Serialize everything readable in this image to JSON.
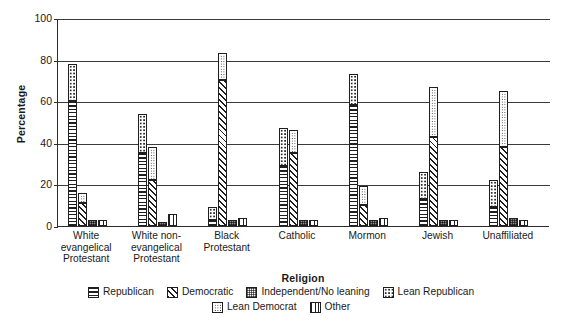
{
  "top_caption": "",
  "axes": {
    "ylabel": "Percentage",
    "xlabel": "Religion",
    "yticks": [
      "0",
      "20",
      "40",
      "60",
      "80",
      "100"
    ]
  },
  "legend": {
    "row1": [
      {
        "label": "Republican",
        "pattern": "p-rep",
        "icon": "horizontal-lines-swatch"
      },
      {
        "label": "Democratic",
        "pattern": "p-dem",
        "icon": "diagonal-hatch-swatch"
      },
      {
        "label": "Independent/No leaning",
        "pattern": "p-ind",
        "icon": "dark-speckle-swatch"
      },
      {
        "label": "Lean Republican",
        "pattern": "p-lrep",
        "icon": "open-dots-swatch"
      }
    ],
    "row2": [
      {
        "label": "Lean Democrat",
        "pattern": "p-ldem",
        "icon": "fine-dots-swatch"
      },
      {
        "label": "Other",
        "pattern": "p-oth",
        "icon": "vertical-lines-swatch"
      }
    ]
  },
  "chart_data": {
    "type": "bar",
    "title": "",
    "xlabel": "Religion",
    "ylabel": "Percentage",
    "ylim": [
      0,
      100
    ],
    "yticks": [
      0,
      20,
      40,
      60,
      80,
      100
    ],
    "grid": true,
    "legend_position": "bottom",
    "stacked_pairs": [
      "Republican + Lean Republican stacked on the Republican bar",
      "Democratic + Lean Democrat stacked on the Democratic bar"
    ],
    "categories": [
      "White evangelical Protestant",
      "White non-evangelical Protestant",
      "Black Protestant",
      "Catholic",
      "Mormon",
      "Jewish",
      "Unaffiliated"
    ],
    "series": [
      {
        "name": "Republican",
        "values": [
          60,
          35,
          3,
          29,
          58,
          13,
          9
        ]
      },
      {
        "name": "Lean Republican",
        "values": [
          18,
          19,
          6,
          18,
          15,
          13,
          13
        ]
      },
      {
        "name": "Democratic",
        "values": [
          11,
          22,
          70,
          35,
          10,
          43,
          38
        ]
      },
      {
        "name": "Lean Democrat",
        "values": [
          5,
          16,
          13,
          11,
          9,
          24,
          27
        ]
      },
      {
        "name": "Independent/No leaning",
        "values": [
          3,
          2,
          3,
          3,
          3,
          3,
          4
        ]
      },
      {
        "name": "Other",
        "values": [
          3,
          6,
          4,
          3,
          4,
          3,
          3
        ]
      }
    ],
    "bar_totals": {
      "Republican_stack": [
        78,
        54,
        9,
        47,
        73,
        26,
        22
      ],
      "Democratic_stack": [
        16,
        38,
        83,
        46,
        19,
        67,
        65
      ]
    }
  },
  "groups": [
    {
      "name": "White evangelical Protestant",
      "label_lines": [
        "White",
        "evangelical",
        "Protestant"
      ],
      "bars": [
        {
          "key": "republican",
          "base": 60,
          "top": 18,
          "base_pattern": "p-rep",
          "top_pattern": "p-lrep"
        },
        {
          "key": "democratic",
          "base": 11,
          "top": 5,
          "base_pattern": "p-dem",
          "top_pattern": "p-ldem"
        },
        {
          "key": "independent",
          "base": 3,
          "top": 0,
          "base_pattern": "p-ind",
          "top_pattern": ""
        },
        {
          "key": "other",
          "base": 3,
          "top": 0,
          "base_pattern": "p-oth",
          "top_pattern": ""
        }
      ]
    },
    {
      "name": "White non-evangelical Protestant",
      "label_lines": [
        "White non-",
        "evangelical",
        "Protestant"
      ],
      "bars": [
        {
          "key": "republican",
          "base": 35,
          "top": 19,
          "base_pattern": "p-rep",
          "top_pattern": "p-lrep"
        },
        {
          "key": "democratic",
          "base": 22,
          "top": 16,
          "base_pattern": "p-dem",
          "top_pattern": "p-ldem"
        },
        {
          "key": "independent",
          "base": 2,
          "top": 0,
          "base_pattern": "p-ind",
          "top_pattern": ""
        },
        {
          "key": "other",
          "base": 6,
          "top": 0,
          "base_pattern": "p-oth",
          "top_pattern": ""
        }
      ]
    },
    {
      "name": "Black Protestant",
      "label_lines": [
        "Black",
        "Protestant"
      ],
      "bars": [
        {
          "key": "republican",
          "base": 3,
          "top": 6,
          "base_pattern": "p-rep",
          "top_pattern": "p-lrep"
        },
        {
          "key": "democratic",
          "base": 70,
          "top": 13,
          "base_pattern": "p-dem",
          "top_pattern": "p-ldem"
        },
        {
          "key": "independent",
          "base": 3,
          "top": 0,
          "base_pattern": "p-ind",
          "top_pattern": ""
        },
        {
          "key": "other",
          "base": 4,
          "top": 0,
          "base_pattern": "p-oth",
          "top_pattern": ""
        }
      ]
    },
    {
      "name": "Catholic",
      "label_lines": [
        "Catholic"
      ],
      "bars": [
        {
          "key": "republican",
          "base": 29,
          "top": 18,
          "base_pattern": "p-rep",
          "top_pattern": "p-lrep"
        },
        {
          "key": "democratic",
          "base": 35,
          "top": 11,
          "base_pattern": "p-dem",
          "top_pattern": "p-ldem"
        },
        {
          "key": "independent",
          "base": 3,
          "top": 0,
          "base_pattern": "p-ind",
          "top_pattern": ""
        },
        {
          "key": "other",
          "base": 3,
          "top": 0,
          "base_pattern": "p-oth",
          "top_pattern": ""
        }
      ]
    },
    {
      "name": "Mormon",
      "label_lines": [
        "Mormon"
      ],
      "bars": [
        {
          "key": "republican",
          "base": 58,
          "top": 15,
          "base_pattern": "p-rep",
          "top_pattern": "p-lrep"
        },
        {
          "key": "democratic",
          "base": 10,
          "top": 9,
          "base_pattern": "p-dem",
          "top_pattern": "p-ldem"
        },
        {
          "key": "independent",
          "base": 3,
          "top": 0,
          "base_pattern": "p-ind",
          "top_pattern": ""
        },
        {
          "key": "other",
          "base": 4,
          "top": 0,
          "base_pattern": "p-oth",
          "top_pattern": ""
        }
      ]
    },
    {
      "name": "Jewish",
      "label_lines": [
        "Jewish"
      ],
      "bars": [
        {
          "key": "republican",
          "base": 13,
          "top": 13,
          "base_pattern": "p-rep",
          "top_pattern": "p-lrep"
        },
        {
          "key": "democratic",
          "base": 43,
          "top": 24,
          "base_pattern": "p-dem",
          "top_pattern": "p-ldem"
        },
        {
          "key": "independent",
          "base": 3,
          "top": 0,
          "base_pattern": "p-ind",
          "top_pattern": ""
        },
        {
          "key": "other",
          "base": 3,
          "top": 0,
          "base_pattern": "p-oth",
          "top_pattern": ""
        }
      ]
    },
    {
      "name": "Unaffiliated",
      "label_lines": [
        "Unaffiliated"
      ],
      "bars": [
        {
          "key": "republican",
          "base": 9,
          "top": 13,
          "base_pattern": "p-rep",
          "top_pattern": "p-lrep"
        },
        {
          "key": "democratic",
          "base": 38,
          "top": 27,
          "base_pattern": "p-dem",
          "top_pattern": "p-ldem"
        },
        {
          "key": "independent",
          "base": 4,
          "top": 0,
          "base_pattern": "p-ind",
          "top_pattern": ""
        },
        {
          "key": "other",
          "base": 3,
          "top": 0,
          "base_pattern": "p-oth",
          "top_pattern": ""
        }
      ]
    }
  ]
}
